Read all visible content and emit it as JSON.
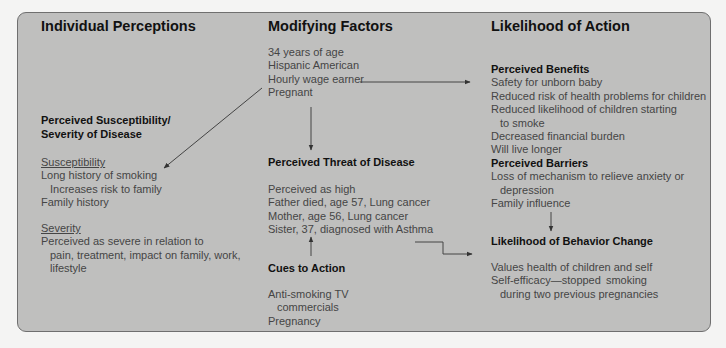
{
  "columns": {
    "individual": {
      "title": "Individual Perceptions",
      "section_title_1": "Perceived Susceptibility/",
      "section_title_2": "Severity of Disease",
      "susceptibility_label": "Susceptibility",
      "susceptibility_items": [
        "Long history of smoking",
        "Increases risk to family",
        "Family history"
      ],
      "severity_label": "Severity",
      "severity_items": [
        "Perceived as severe in relation to",
        "pain, treatment, impact on family, work,",
        "lifestyle"
      ]
    },
    "modifying": {
      "title": "Modifying Factors",
      "demographics": [
        "34 years of age",
        "Hispanic American",
        "Hourly wage earner",
        "Pregnant"
      ],
      "threat_title": "Perceived Threat of Disease",
      "threat_items": [
        "Perceived as high",
        "Father died, age 57, Lung cancer",
        "Mother, age 56, Lung cancer",
        "Sister, 37, diagnosed with Asthma"
      ],
      "cues_title": "Cues to Action",
      "cues_items": [
        "Anti-smoking TV",
        "commercials",
        "Pregnancy"
      ]
    },
    "likelihood": {
      "title": "Likelihood of Action",
      "benefits_title": "Perceived Benefits",
      "benefits_items": [
        "Safety for unborn baby",
        "Reduced risk of health problems for children",
        "Reduced likelihood of children starting",
        "to smoke",
        "Decreased financial burden",
        "Will live longer"
      ],
      "barriers_title": "Perceived Barriers",
      "barriers_items": [
        "Loss of mechanism to relieve anxiety or",
        "depression",
        "Family influence"
      ],
      "behavior_title": "Likelihood of Behavior Change",
      "behavior_items": [
        "Values health of children and self",
        "Self-efficacy—stopped  smoking",
        "during two previous pregnancies"
      ]
    }
  },
  "colors": {
    "panel_bg": "#bfbfbe",
    "panel_border": "#6f6f6f",
    "heading_text": "#111111",
    "body_text": "#454545",
    "arrow": "#333333"
  }
}
